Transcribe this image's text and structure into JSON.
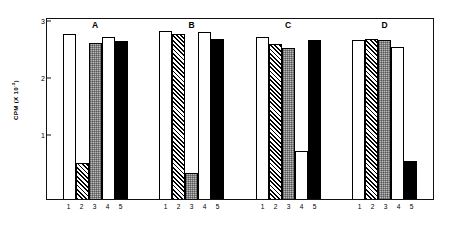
{
  "chart_data": {
    "type": "bar",
    "title": "",
    "subtitle": "",
    "xlabel": "",
    "ylabel": "CPM (X 10",
    "ylabel_exponent": "-3",
    "ylabel_suffix": ")",
    "ylim": [
      0,
      3.2
    ],
    "yticks": [
      1,
      2,
      3
    ],
    "ytick_labels": [
      "1",
      "2",
      "3"
    ],
    "categories": [
      "1",
      "2",
      "3",
      "4",
      "5"
    ],
    "grid": false,
    "legend": "none",
    "panel_layout": "1x4",
    "bar_styles": [
      "white",
      "hatch",
      "gray",
      "white",
      "black"
    ],
    "panels": [
      {
        "label": "A",
        "categories": [
          "1",
          "2",
          "3",
          "4",
          "5"
        ],
        "values": [
          2.9,
          0.63,
          2.75,
          2.85,
          2.77
        ]
      },
      {
        "label": "B",
        "categories": [
          "1",
          "2",
          "3",
          "4",
          "5"
        ],
        "values": [
          2.95,
          2.9,
          0.45,
          2.93,
          2.82
        ]
      },
      {
        "label": "C",
        "categories": [
          "1",
          "2",
          "3",
          "4",
          "5"
        ],
        "values": [
          2.85,
          2.72,
          2.65,
          0.85,
          2.8
        ]
      },
      {
        "label": "D",
        "categories": [
          "1",
          "2",
          "3",
          "4",
          "5"
        ],
        "values": [
          2.8,
          2.82,
          2.8,
          2.68,
          0.67
        ]
      }
    ]
  },
  "axes": {
    "y_title_text": "CPM (X 10",
    "y_title_exponent": "-3",
    "y_title_close": ")"
  },
  "colors": {
    "axis": "#111111",
    "bar_white": "#ffffff",
    "bar_black": "#000000",
    "bar_gray": "#b9b9b9",
    "background": "#ffffff"
  }
}
